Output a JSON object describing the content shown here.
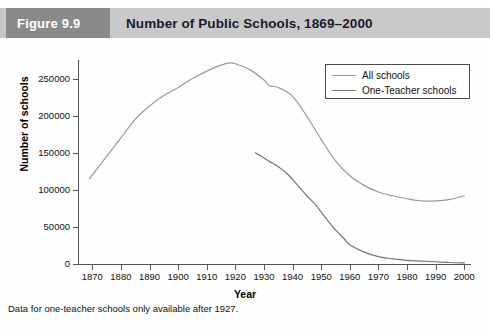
{
  "header": {
    "figure_number": "Figure 9.9",
    "title": "Number of Public Schools, 1869–2000",
    "badge_bg": "#8a8a8a",
    "bar_bg": "#c9c9c9"
  },
  "footnote": "Data for one-teacher schools only available after 1927.",
  "chart_data": {
    "type": "line",
    "title": "Number of Public Schools, 1869–2000",
    "xlabel": "Year",
    "ylabel": "Number of schools",
    "xlim": [
      1865,
      2002
    ],
    "ylim": [
      0,
      275000
    ],
    "xticks": [
      1870,
      1880,
      1890,
      1900,
      1910,
      1920,
      1930,
      1940,
      1950,
      1960,
      1970,
      1980,
      1990,
      2000
    ],
    "yticks": [
      0,
      50000,
      100000,
      150000,
      200000,
      250000
    ],
    "ytick_labels": [
      "0",
      "50000",
      "100000",
      "150000",
      "200000",
      "250000"
    ],
    "grid": false,
    "legend_position": "top-right",
    "series": [
      {
        "name": "All schools",
        "color": "#9a9a9a",
        "x": [
          1869,
          1875,
          1880,
          1885,
          1890,
          1895,
          1900,
          1905,
          1910,
          1915,
          1918,
          1920,
          1925,
          1930,
          1932,
          1935,
          1940,
          1945,
          1950,
          1955,
          1960,
          1965,
          1970,
          1975,
          1980,
          1985,
          1990,
          1995,
          2000
        ],
        "values": [
          115000,
          145000,
          170000,
          195000,
          213000,
          227000,
          238000,
          250000,
          260000,
          268000,
          271000,
          270000,
          262000,
          248000,
          240000,
          238000,
          226000,
          199000,
          168000,
          139000,
          119000,
          106000,
          97000,
          92000,
          88000,
          85000,
          85000,
          87000,
          92000
        ]
      },
      {
        "name": "One-Teacher schools",
        "color": "#787878",
        "x": [
          1927,
          1930,
          1932,
          1935,
          1938,
          1940,
          1942,
          1945,
          1948,
          1950,
          1952,
          1955,
          1958,
          1960,
          1965,
          1970,
          1975,
          1980,
          1985,
          1990,
          1995,
          2000
        ],
        "values": [
          150000,
          143000,
          138000,
          131000,
          122000,
          114000,
          105000,
          92000,
          80000,
          70000,
          60000,
          46000,
          34000,
          26000,
          16000,
          10000,
          7000,
          5000,
          4000,
          3000,
          2000,
          1500
        ]
      }
    ],
    "legend": [
      {
        "label": "All schools",
        "color": "#9a9a9a"
      },
      {
        "label": "One-Teacher schools",
        "color": "#787878"
      }
    ]
  }
}
